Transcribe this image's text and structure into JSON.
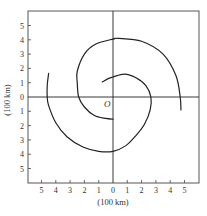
{
  "figure": {
    "type": "spiral-arm-diagram",
    "x_axis_label": "(100 km)",
    "y_axis_label": "(100 km)",
    "origin_label": "O",
    "x_ticks_left": [
      "5",
      "4",
      "3",
      "2",
      "1"
    ],
    "x_tick_zero": "0",
    "x_ticks_right": [
      "1",
      "2",
      "3",
      "4",
      "5"
    ],
    "y_ticks_up": [
      "1",
      "2",
      "3",
      "4",
      "5"
    ],
    "y_tick_zero": "0",
    "y_ticks_down": [
      "1",
      "2",
      "3",
      "4",
      "5"
    ],
    "axis_range": {
      "x": [
        -6,
        6
      ],
      "y": [
        -6,
        6
      ]
    },
    "unit_px": 14.3,
    "colors": {
      "line": "#222222",
      "text": "#333333",
      "frame": "#444444"
    }
  },
  "curves": [
    {
      "name": "spiral-arm-a",
      "points": [
        [
          4.75,
          -0.9
        ],
        [
          4.7,
          0
        ],
        [
          4.4,
          1.5
        ],
        [
          3.5,
          3.0
        ],
        [
          2.0,
          3.9
        ],
        [
          0.4,
          4.1
        ],
        [
          0,
          4.05
        ],
        [
          -1.2,
          3.7
        ],
        [
          -2.0,
          3.0
        ],
        [
          -2.5,
          1.8
        ],
        [
          -2.5,
          1.0
        ],
        [
          -2.4,
          0
        ],
        [
          -2.0,
          -0.7
        ],
        [
          -1.3,
          -1.3
        ],
        [
          -0.5,
          -1.5
        ],
        [
          0,
          -1.55
        ]
      ]
    },
    {
      "name": "spiral-arm-b",
      "points": [
        [
          -0.75,
          1.05
        ],
        [
          -0.3,
          1.3
        ],
        [
          0,
          1.4
        ],
        [
          0.8,
          1.6
        ],
        [
          1.6,
          1.35
        ],
        [
          2.3,
          0.8
        ],
        [
          2.65,
          0
        ],
        [
          2.6,
          -0.9
        ],
        [
          2.2,
          -1.9
        ],
        [
          1.6,
          -2.7
        ],
        [
          0.9,
          -3.4
        ],
        [
          0,
          -3.8
        ],
        [
          -1.0,
          -3.8
        ],
        [
          -2.1,
          -3.5
        ],
        [
          -3.2,
          -2.8
        ],
        [
          -4.0,
          -1.8
        ],
        [
          -4.5,
          -0.6
        ],
        [
          -4.6,
          0
        ],
        [
          -4.6,
          0.8
        ],
        [
          -4.5,
          1.65
        ]
      ]
    }
  ]
}
